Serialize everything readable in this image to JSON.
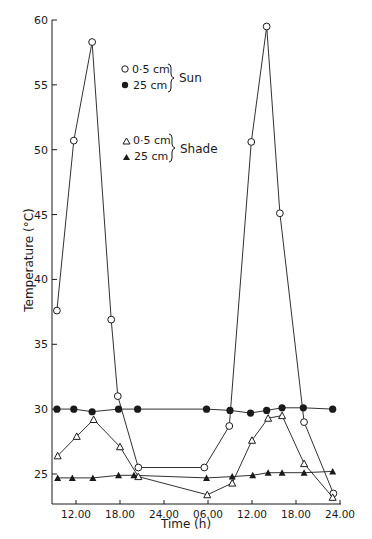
{
  "chart_data": {
    "type": "line",
    "title": "",
    "xlabel": "Time (h)",
    "ylabel": "Temperature (°C)",
    "ylim": [
      22.5,
      60
    ],
    "yticks": [
      25,
      30,
      35,
      40,
      45,
      50,
      55,
      60
    ],
    "xticks": [
      {
        "h": 12,
        "label": "12.00"
      },
      {
        "h": 18,
        "label": "18.00"
      },
      {
        "h": 24,
        "label": "24.00"
      },
      {
        "h": 30,
        "label": "06.00"
      },
      {
        "h": 36,
        "label": "12.00"
      },
      {
        "h": 42,
        "label": "18.00"
      },
      {
        "h": 48,
        "label": "24.00"
      }
    ],
    "xlim_hours": [
      8.7,
      48.1
    ],
    "grid": false,
    "legend": {
      "position": "upper-center",
      "groups": [
        {
          "name": "Sun",
          "entries": [
            "0·5 cm",
            "25 cm"
          ]
        },
        {
          "name": "Shade",
          "entries": [
            "0·5 cm",
            "25 cm"
          ]
        }
      ]
    },
    "series": [
      {
        "name": "Sun 0·5 cm",
        "marker": "open-circle",
        "x": [
          9.4,
          11.7,
          14.2,
          16.8,
          17.7,
          20.5,
          29.5,
          32.9,
          35.9,
          38.0,
          39.8,
          43.1,
          47.1
        ],
        "values": [
          37.6,
          50.7,
          58.3,
          36.9,
          31.0,
          25.5,
          25.5,
          28.7,
          50.6,
          59.5,
          45.1,
          29.0,
          23.5
        ]
      },
      {
        "name": "Sun 25 cm",
        "marker": "filled-circle",
        "x": [
          9.4,
          11.7,
          14.2,
          17.8,
          20.4,
          29.8,
          33.0,
          35.8,
          38.0,
          40.1,
          43.0,
          47.0
        ],
        "values": [
          30.0,
          30.0,
          29.8,
          30.0,
          30.0,
          30.0,
          29.9,
          29.7,
          29.9,
          30.1,
          30.1,
          30.0
        ]
      },
      {
        "name": "Shade 0·5 cm",
        "marker": "open-triangle",
        "x": [
          9.5,
          12.1,
          14.4,
          18.0,
          20.5,
          29.9,
          33.3,
          36.0,
          38.2,
          40.1,
          43.1,
          47.0
        ],
        "values": [
          26.4,
          27.9,
          29.2,
          27.1,
          24.8,
          23.4,
          24.3,
          27.6,
          29.3,
          29.5,
          25.8,
          23.2
        ]
      },
      {
        "name": "Shade 25 cm",
        "marker": "filled-triangle",
        "x": [
          9.5,
          11.5,
          14.3,
          17.8,
          19.9,
          29.8,
          33.3,
          36.1,
          38.2,
          40.1,
          43.1,
          47.0
        ],
        "values": [
          24.7,
          24.7,
          24.7,
          24.9,
          24.9,
          24.7,
          24.8,
          24.9,
          25.1,
          25.1,
          25.1,
          25.2
        ]
      }
    ]
  },
  "legend": {
    "sun_label": "Sun",
    "shade_label": "Shade",
    "sun_entries": [
      "0·5 cm",
      "25 cm"
    ],
    "shade_entries": [
      "0·5 cm",
      "25 cm"
    ]
  },
  "axes": {
    "ylabel": "Temperature (°C)",
    "xlabel": "Time (h)"
  },
  "colors": {
    "ink": "#1a1a1a",
    "background": "#ffffff"
  }
}
